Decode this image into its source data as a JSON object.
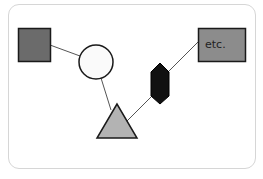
{
  "diagram": {
    "title": "",
    "nodes": [
      {
        "id": "square",
        "shape": "square",
        "fill": "#6b6b6b",
        "stroke": "#1a1a1a",
        "x": 18,
        "y": 28,
        "w": 32,
        "h": 33,
        "label": ""
      },
      {
        "id": "circle",
        "shape": "circle",
        "fill": "#fafafa",
        "stroke": "#1a1a1a",
        "cx": 96,
        "cy": 62,
        "r": 17,
        "label": ""
      },
      {
        "id": "triangle",
        "shape": "triangle",
        "fill": "#b3b3b3",
        "stroke": "#1a1a1a",
        "points": "117,104 97,138 137,138",
        "label": ""
      },
      {
        "id": "hexagon",
        "shape": "elongated-hexagon",
        "fill": "#111111",
        "stroke": "#000000",
        "points": "160,63 169,72 169,96 160,104 151,96 151,72",
        "label": ""
      },
      {
        "id": "etc-box",
        "shape": "rectangle",
        "fill": "#8c8c8c",
        "stroke": "#1a1a1a",
        "x": 198,
        "y": 28,
        "w": 47,
        "h": 33,
        "label": "etc."
      }
    ],
    "edges": [
      {
        "from": "square",
        "to": "circle",
        "x1": 50,
        "y1": 45,
        "x2": 80,
        "y2": 56
      },
      {
        "from": "circle",
        "to": "triangle",
        "x1": 101,
        "y1": 78,
        "x2": 111,
        "y2": 110
      },
      {
        "from": "triangle",
        "to": "hexagon",
        "x1": 127,
        "y1": 121,
        "x2": 152,
        "y2": 96
      },
      {
        "from": "hexagon",
        "to": "etc-box",
        "x1": 168,
        "y1": 72,
        "x2": 198,
        "y2": 42
      }
    ],
    "colors": {
      "frame_border": "#d6d6d6",
      "edge": "#555555"
    }
  }
}
